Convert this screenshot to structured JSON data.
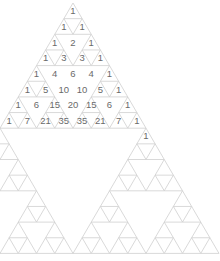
{
  "diagram": {
    "apex": {
      "x": 73,
      "y": 3
    },
    "row_height": 15.65,
    "cell_width": 18.25,
    "total_rows": 16,
    "numbered_rows": [
      [
        "1"
      ],
      [
        "1",
        "1"
      ],
      [
        "1",
        "2",
        "1"
      ],
      [
        "1",
        "3",
        "3",
        "1"
      ],
      [
        "1",
        "4",
        "6",
        "4",
        "1"
      ],
      [
        "1",
        "5",
        "10",
        "10",
        "5",
        "1"
      ],
      [
        "1",
        "6",
        "15",
        "20",
        "15",
        "6",
        "1"
      ],
      [
        "1",
        "7",
        "21",
        "35",
        "35",
        "21",
        "7",
        "1"
      ]
    ],
    "extra_labels": [
      {
        "row": 8,
        "pos": 8,
        "text": "1"
      }
    ],
    "colors": {
      "line": "#cfcfcf",
      "text": "#6a6a6a",
      "background": "#ffffff"
    }
  }
}
